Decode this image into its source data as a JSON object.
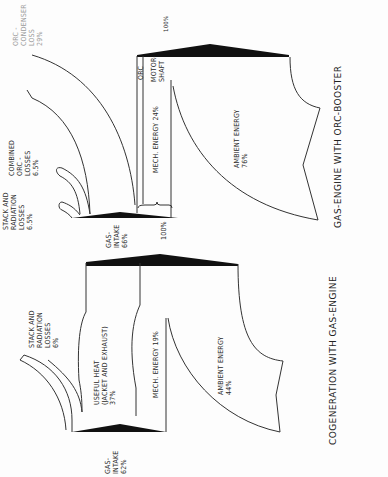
{
  "diagram_top": {
    "title": "GAS-ENGINE WITH ORC-BOOSTER",
    "input_total": "100%",
    "gas_intake": "GAS-\nINTAKE\n66%",
    "ambient_energy": "AMBIENT ENERGY\n76%",
    "mech_energy": "MECH. ENERGY 24%",
    "motor_shaft": "MOTOR-\nSHAFT",
    "orc": "ORC",
    "stack_losses": "STACK AND\nRADIATION\nLOSSES\n6.5%",
    "combined_orc_losses": "COMBINED\nORC -\nLOSSES\n6.5%",
    "orc_condenser_loss": "ORC -\nCONDENSER\nLOSS\n29%"
  },
  "diagram_bottom": {
    "title": "COGENERATION WITH GAS-ENGINE",
    "input_total": "100%",
    "gas_intake": "GAS-\nINTAKE\n62%",
    "ambient_energy": "AMBIENT ENERGY\n44%",
    "mech_energy": "MECH. ENERGY 19%",
    "useful_heat": "USEFUL HEAT\n(JACKET AND EXHAUST)\n37%",
    "stack_losses": "STACK AND\nRADIATION\nLOSSES\n6%"
  }
}
